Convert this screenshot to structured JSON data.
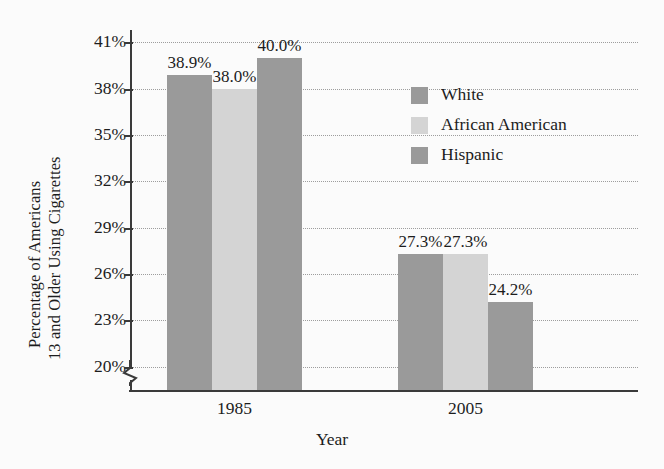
{
  "chart_data": {
    "type": "bar",
    "title": "",
    "subtitle": "",
    "xlabel": "Year",
    "ylabel": "Percentage of Americans 13 and Older Using Cigarettes",
    "ylabel_lines": [
      "Percentage of Americans",
      "13 and Older Using Cigarettes"
    ],
    "categories": [
      "1985",
      "2005"
    ],
    "series": [
      {
        "name": "White",
        "values": [
          38.9,
          27.3
        ],
        "color": "#9a9a9a"
      },
      {
        "name": "African American",
        "values": [
          38.0,
          27.3
        ],
        "color": "#d4d4d4"
      },
      {
        "name": "Hispanic",
        "values": [
          40.0,
          24.2
        ],
        "color": "#9a9a9a"
      }
    ],
    "value_labels": [
      [
        "38.9%",
        "38.0%",
        "40.0%"
      ],
      [
        "27.3%",
        "27.3%",
        "24.2%"
      ]
    ],
    "ylim": [
      18.5,
      41.8
    ],
    "yticks": [
      20,
      23,
      26,
      29,
      32,
      35,
      38,
      41
    ],
    "ytick_labels": [
      "20%",
      "23%",
      "26%",
      "29%",
      "32%",
      "35%",
      "38%",
      "41%"
    ],
    "grid": true,
    "grid_style": "dotted",
    "axis_break": true,
    "legend_position": "upper right",
    "legend_entries": [
      "White",
      "African American",
      "Hispanic"
    ],
    "background_color": "#fbfbfb",
    "axis_color": "#3a3a3a"
  }
}
